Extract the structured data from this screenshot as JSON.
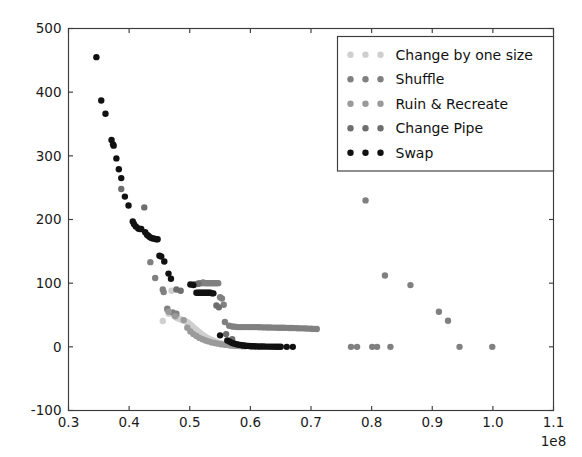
{
  "chart_data": {
    "type": "scatter",
    "title": "",
    "xlabel": "",
    "ylabel": "",
    "x_exponent_label": "1e8",
    "x_scale_factor": 100000000,
    "xlim": [
      0.3,
      1.1
    ],
    "ylim": [
      -100,
      500
    ],
    "xticks": [
      0.3,
      0.4,
      0.5,
      0.6,
      0.7,
      0.8,
      0.9,
      1.0,
      1.1
    ],
    "xtick_labels": [
      "0.3",
      "0.4",
      "0.5",
      "0.6",
      "0.7",
      "0.8",
      "0.9",
      "1.0",
      "1.1"
    ],
    "yticks": [
      -100,
      0,
      100,
      200,
      300,
      400,
      500
    ],
    "ytick_labels": [
      "-100",
      "0",
      "100",
      "200",
      "300",
      "400",
      "500"
    ],
    "grid": false,
    "legend_position": "upper right",
    "marker_size": 4.2,
    "series": [
      {
        "name": "Change by one size",
        "color": "#cfcfcf",
        "points": [
          [
            0.4555,
            40.5
          ],
          [
            0.4625,
            58.0
          ],
          [
            0.4655,
            52.0
          ],
          [
            0.47,
            88.0
          ],
          [
            0.4735,
            50.0
          ],
          [
            0.476,
            47.5
          ],
          [
            0.4785,
            46.0
          ],
          [
            0.48,
            45.0
          ],
          [
            0.483,
            44.0
          ],
          [
            0.4855,
            43.0
          ],
          [
            0.488,
            42.0
          ],
          [
            0.4905,
            41.0
          ],
          [
            0.493,
            40.0
          ],
          [
            0.4955,
            39.0
          ],
          [
            0.498,
            37.0
          ],
          [
            0.5005,
            35.0
          ],
          [
            0.503,
            33.0
          ],
          [
            0.5055,
            31.0
          ],
          [
            0.508,
            29.0
          ],
          [
            0.5105,
            27.0
          ],
          [
            0.513,
            25.0
          ],
          [
            0.5155,
            23.0
          ],
          [
            0.518,
            21.0
          ],
          [
            0.5205,
            19.0
          ],
          [
            0.523,
            17.5
          ],
          [
            0.5255,
            16.0
          ],
          [
            0.528,
            14.5
          ],
          [
            0.5305,
            13.0
          ],
          [
            0.533,
            12.0
          ],
          [
            0.5355,
            11.0
          ],
          [
            0.538,
            10.0
          ],
          [
            0.5405,
            9.0
          ],
          [
            0.543,
            8.0
          ],
          [
            0.5455,
            7.0
          ],
          [
            0.548,
            6.0
          ],
          [
            0.5505,
            5.5
          ],
          [
            0.553,
            5.0
          ],
          [
            0.5555,
            4.5
          ],
          [
            0.558,
            4.0
          ],
          [
            0.5605,
            3.5
          ],
          [
            0.563,
            3.0
          ],
          [
            0.5655,
            2.5
          ],
          [
            0.568,
            2.0
          ],
          [
            0.5705,
            1.8
          ],
          [
            0.573,
            1.5
          ],
          [
            0.5755,
            1.2
          ]
        ]
      },
      {
        "name": "Shuffle",
        "color": "#808080",
        "points": [
          [
            0.435,
            133.0
          ],
          [
            0.443,
            108.0
          ],
          [
            0.4555,
            90.0
          ],
          [
            0.457,
            86.0
          ],
          [
            0.463,
            60.0
          ],
          [
            0.472,
            54.0
          ],
          [
            0.478,
            52.0
          ],
          [
            0.508,
            98.0
          ],
          [
            0.513,
            99.0
          ],
          [
            0.5175,
            100.0
          ],
          [
            0.5195,
            100.0
          ],
          [
            0.522,
            101.0
          ],
          [
            0.5245,
            100.0
          ],
          [
            0.527,
            100.0
          ],
          [
            0.5295,
            100.0
          ],
          [
            0.532,
            100.0
          ],
          [
            0.5345,
            100.0
          ],
          [
            0.537,
            100.0
          ],
          [
            0.5395,
            100.0
          ],
          [
            0.542,
            100.0
          ],
          [
            0.5445,
            100.0
          ],
          [
            0.547,
            100.0
          ],
          [
            0.55,
            78.0
          ],
          [
            0.553,
            76.0
          ],
          [
            0.556,
            66.0
          ],
          [
            0.558,
            39.0
          ],
          [
            0.565,
            33.0
          ],
          [
            0.57,
            32.0
          ],
          [
            0.5745,
            31.5
          ],
          [
            0.579,
            31.0
          ],
          [
            0.5835,
            31.0
          ],
          [
            0.588,
            31.0
          ],
          [
            0.5925,
            31.0
          ],
          [
            0.597,
            31.0
          ],
          [
            0.6015,
            31.0
          ],
          [
            0.606,
            31.0
          ],
          [
            0.6105,
            31.0
          ],
          [
            0.615,
            30.8
          ],
          [
            0.6195,
            30.6
          ],
          [
            0.624,
            30.5
          ],
          [
            0.6285,
            30.4
          ],
          [
            0.633,
            30.3
          ],
          [
            0.6375,
            30.2
          ],
          [
            0.642,
            30.1
          ],
          [
            0.6465,
            30.0
          ],
          [
            0.651,
            30.0
          ],
          [
            0.6555,
            30.0
          ],
          [
            0.66,
            29.8
          ],
          [
            0.6645,
            29.6
          ],
          [
            0.669,
            29.5
          ],
          [
            0.6735,
            29.4
          ],
          [
            0.678,
            29.2
          ],
          [
            0.6825,
            29.0
          ],
          [
            0.687,
            29.0
          ],
          [
            0.6915,
            28.8
          ],
          [
            0.696,
            28.6
          ],
          [
            0.7005,
            28.4
          ],
          [
            0.705,
            28.2
          ],
          [
            0.7095,
            28.0
          ],
          [
            0.79,
            230.0
          ],
          [
            0.822,
            112.0
          ],
          [
            0.864,
            97.0
          ],
          [
            0.911,
            55.0
          ],
          [
            0.926,
            41.0
          ],
          [
            0.766,
            0.0
          ],
          [
            0.776,
            0.0
          ],
          [
            0.801,
            0.0
          ],
          [
            0.809,
            0.0
          ],
          [
            0.831,
            0.0
          ],
          [
            0.945,
            0.0
          ],
          [
            0.999,
            0.0
          ]
        ]
      },
      {
        "name": "Ruin & Recreate",
        "color": "#9a9a9a",
        "points": [
          [
            0.465,
            55.0
          ],
          [
            0.476,
            48.0
          ],
          [
            0.49,
            42.0
          ],
          [
            0.496,
            30.0
          ],
          [
            0.501,
            24.0
          ],
          [
            0.506,
            20.0
          ],
          [
            0.511,
            17.0
          ],
          [
            0.516,
            14.0
          ],
          [
            0.521,
            12.0
          ],
          [
            0.526,
            10.0
          ],
          [
            0.531,
            8.5
          ],
          [
            0.536,
            7.0
          ],
          [
            0.541,
            6.0
          ],
          [
            0.546,
            5.0
          ],
          [
            0.551,
            4.0
          ],
          [
            0.556,
            3.5
          ],
          [
            0.561,
            3.0
          ],
          [
            0.566,
            2.5
          ],
          [
            0.571,
            2.0
          ],
          [
            0.576,
            1.5
          ],
          [
            0.581,
            1.2
          ],
          [
            0.586,
            1.0
          ],
          [
            0.591,
            0.8
          ]
        ]
      },
      {
        "name": "Change Pipe",
        "color": "#6e6e6e",
        "points": [
          [
            0.387,
            248.0
          ],
          [
            0.425,
            219.0
          ],
          [
            0.478,
            90.0
          ],
          [
            0.485,
            88.0
          ],
          [
            0.506,
            98.0
          ],
          [
            0.514,
            99.0
          ],
          [
            0.544,
            65.0
          ],
          [
            0.548,
            62.0
          ],
          [
            0.56,
            20.0
          ],
          [
            0.57,
            12.0
          ]
        ]
      },
      {
        "name": "Swap",
        "color": "#111111",
        "points": [
          [
            0.346,
            455.0
          ],
          [
            0.354,
            387.0
          ],
          [
            0.361,
            366.0
          ],
          [
            0.371,
            325.0
          ],
          [
            0.3735,
            318.0
          ],
          [
            0.3745,
            316.0
          ],
          [
            0.379,
            296.0
          ],
          [
            0.383,
            279.0
          ],
          [
            0.387,
            265.0
          ],
          [
            0.393,
            236.0
          ],
          [
            0.399,
            222.0
          ],
          [
            0.406,
            197.0
          ],
          [
            0.408,
            193.0
          ],
          [
            0.411,
            189.0
          ],
          [
            0.415,
            186.0
          ],
          [
            0.4175,
            185.0
          ],
          [
            0.42,
            185.0
          ],
          [
            0.4265,
            180.0
          ],
          [
            0.4295,
            176.0
          ],
          [
            0.432,
            174.0
          ],
          [
            0.4345,
            172.0
          ],
          [
            0.437,
            171.0
          ],
          [
            0.4395,
            170.0
          ],
          [
            0.442,
            170.0
          ],
          [
            0.4445,
            169.0
          ],
          [
            0.447,
            169.0
          ],
          [
            0.45,
            143.0
          ],
          [
            0.453,
            142.0
          ],
          [
            0.458,
            134.0
          ],
          [
            0.465,
            115.0
          ],
          [
            0.469,
            107.0
          ],
          [
            0.501,
            98.0
          ],
          [
            0.506,
            97.0
          ],
          [
            0.511,
            85.0
          ],
          [
            0.514,
            85.0
          ],
          [
            0.5165,
            85.0
          ],
          [
            0.519,
            85.0
          ],
          [
            0.5215,
            85.0
          ],
          [
            0.524,
            85.0
          ],
          [
            0.5265,
            85.0
          ],
          [
            0.529,
            85.0
          ],
          [
            0.5315,
            85.0
          ],
          [
            0.534,
            85.0
          ],
          [
            0.5365,
            84.0
          ],
          [
            0.539,
            84.0
          ],
          [
            0.55,
            18.0
          ],
          [
            0.562,
            10.0
          ],
          [
            0.566,
            8.0
          ],
          [
            0.57,
            6.0
          ],
          [
            0.574,
            5.0
          ],
          [
            0.577,
            4.0
          ],
          [
            0.58,
            3.5
          ],
          [
            0.583,
            3.0
          ],
          [
            0.586,
            2.5
          ],
          [
            0.589,
            2.0
          ],
          [
            0.592,
            1.8
          ],
          [
            0.595,
            1.5
          ],
          [
            0.598,
            1.2
          ],
          [
            0.601,
            1.0
          ],
          [
            0.604,
            0.9
          ],
          [
            0.607,
            0.8
          ],
          [
            0.61,
            0.7
          ],
          [
            0.614,
            0.6
          ],
          [
            0.618,
            0.5
          ],
          [
            0.622,
            0.5
          ],
          [
            0.626,
            0.4
          ],
          [
            0.63,
            0.4
          ],
          [
            0.634,
            0.3
          ],
          [
            0.638,
            0.3
          ],
          [
            0.642,
            0.2
          ],
          [
            0.646,
            0.2
          ],
          [
            0.65,
            0.2
          ],
          [
            0.66,
            0.0
          ],
          [
            0.67,
            0.0
          ]
        ]
      }
    ]
  },
  "legend": {
    "entries": [
      {
        "label": "Change by one size",
        "color": "#cfcfcf"
      },
      {
        "label": "Shuffle",
        "color": "#808080"
      },
      {
        "label": "Ruin & Recreate",
        "color": "#9a9a9a"
      },
      {
        "label": "Change Pipe",
        "color": "#6e6e6e"
      },
      {
        "label": "Swap",
        "color": "#111111"
      }
    ]
  }
}
